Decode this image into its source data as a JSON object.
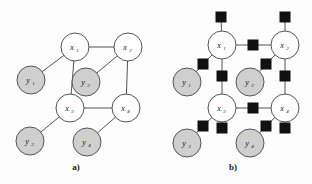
{
  "figure": {
    "background_color": "#fdfdfd",
    "hidden_node_fill": "#ffffff",
    "observed_node_fill": "#cfcfcf",
    "node_stroke": "#555555",
    "factor_fill": "#111111",
    "edge_color": "#555555",
    "node_radius": 14,
    "factor_size": 10
  },
  "panels": [
    {
      "id": "panel-a",
      "caption": "a)",
      "caption_x": 76,
      "caption_y": 170,
      "type": "markov-random-field",
      "nodes": [
        {
          "name": "x1",
          "label": "x",
          "sub": "1",
          "cx": 75,
          "cy": 47,
          "kind": "hidden"
        },
        {
          "name": "x2",
          "label": "x",
          "sub": "2",
          "cx": 128,
          "cy": 47,
          "kind": "hidden"
        },
        {
          "name": "x3",
          "label": "x",
          "sub": "3",
          "cx": 70,
          "cy": 108,
          "kind": "hidden"
        },
        {
          "name": "x4",
          "label": "x",
          "sub": "4",
          "cx": 126,
          "cy": 108,
          "kind": "hidden"
        },
        {
          "name": "y1",
          "label": "y",
          "sub": "1",
          "cx": 31,
          "cy": 80,
          "kind": "observed"
        },
        {
          "name": "y2",
          "label": "y",
          "sub": "2",
          "cx": 86,
          "cy": 82,
          "kind": "observed"
        },
        {
          "name": "y3",
          "label": "y",
          "sub": "3",
          "cx": 30,
          "cy": 141,
          "kind": "observed"
        },
        {
          "name": "y4",
          "label": "y",
          "sub": "4",
          "cx": 87,
          "cy": 142,
          "kind": "observed"
        }
      ],
      "edges": [
        {
          "from": "x1",
          "to": "x2"
        },
        {
          "from": "x1",
          "to": "x3"
        },
        {
          "from": "x2",
          "to": "x4"
        },
        {
          "from": "x3",
          "to": "x4"
        },
        {
          "from": "x1",
          "to": "y1"
        },
        {
          "from": "x2",
          "to": "y2"
        },
        {
          "from": "x3",
          "to": "y3"
        },
        {
          "from": "x4",
          "to": "y4"
        }
      ]
    },
    {
      "id": "panel-b",
      "caption": "b)",
      "caption_x": 233,
      "caption_y": 170,
      "type": "factor-graph",
      "nodes": [
        {
          "name": "x1",
          "label": "x",
          "sub": "1",
          "cx": 222,
          "cy": 45,
          "kind": "hidden"
        },
        {
          "name": "x2",
          "label": "x",
          "sub": "2",
          "cx": 285,
          "cy": 45,
          "kind": "hidden"
        },
        {
          "name": "x3",
          "label": "x",
          "sub": "3",
          "cx": 222,
          "cy": 108,
          "kind": "hidden"
        },
        {
          "name": "x4",
          "label": "x",
          "sub": "4",
          "cx": 285,
          "cy": 108,
          "kind": "hidden"
        },
        {
          "name": "y1",
          "label": "y",
          "sub": "1",
          "cx": 187,
          "cy": 82,
          "kind": "observed"
        },
        {
          "name": "y2",
          "label": "y",
          "sub": "2",
          "cx": 250,
          "cy": 82,
          "kind": "observed"
        },
        {
          "name": "y3",
          "label": "y",
          "sub": "3",
          "cx": 187,
          "cy": 143,
          "kind": "observed"
        },
        {
          "name": "y4",
          "label": "y",
          "sub": "4",
          "cx": 250,
          "cy": 143,
          "kind": "observed"
        }
      ],
      "factors": [
        {
          "name": "f-top-x1",
          "cx": 221,
          "cy": 17
        },
        {
          "name": "f-top-x2",
          "cx": 285,
          "cy": 17
        },
        {
          "name": "f-x1-x2",
          "cx": 253,
          "cy": 45
        },
        {
          "name": "f-x1-y1",
          "cx": 203,
          "cy": 64
        },
        {
          "name": "f-x1-x3",
          "cx": 222,
          "cy": 76
        },
        {
          "name": "f-x2-y2",
          "cx": 266,
          "cy": 64
        },
        {
          "name": "f-x2-x4",
          "cx": 285,
          "cy": 76
        },
        {
          "name": "f-x3-x4",
          "cx": 253,
          "cy": 108
        },
        {
          "name": "f-x3-y3",
          "cx": 203,
          "cy": 126
        },
        {
          "name": "f-x3-y4",
          "cx": 222,
          "cy": 128
        },
        {
          "name": "f-x4-y4",
          "cx": 266,
          "cy": 126
        },
        {
          "name": "f-x4-bot",
          "cx": 285,
          "cy": 128
        }
      ],
      "links": [
        {
          "from": "f-top-x1",
          "to": "x1"
        },
        {
          "from": "f-top-x2",
          "to": "x2"
        },
        {
          "from": "x1",
          "to": "f-x1-x2"
        },
        {
          "from": "f-x1-x2",
          "to": "x2"
        },
        {
          "from": "x1",
          "to": "f-x1-y1"
        },
        {
          "from": "f-x1-y1",
          "to": "y1"
        },
        {
          "from": "x1",
          "to": "f-x1-x3"
        },
        {
          "from": "f-x1-x3",
          "to": "x3"
        },
        {
          "from": "x2",
          "to": "f-x2-y2"
        },
        {
          "from": "f-x2-y2",
          "to": "y2"
        },
        {
          "from": "x2",
          "to": "f-x2-x4"
        },
        {
          "from": "f-x2-x4",
          "to": "x4"
        },
        {
          "from": "x3",
          "to": "f-x3-x4"
        },
        {
          "from": "f-x3-x4",
          "to": "x4"
        },
        {
          "from": "x3",
          "to": "f-x3-y3"
        },
        {
          "from": "f-x3-y3",
          "to": "y3"
        },
        {
          "from": "x3",
          "to": "f-x3-y4"
        },
        {
          "from": "x4",
          "to": "f-x4-y4"
        },
        {
          "from": "f-x4-y4",
          "to": "y4"
        },
        {
          "from": "x4",
          "to": "f-x4-bot"
        }
      ]
    }
  ]
}
